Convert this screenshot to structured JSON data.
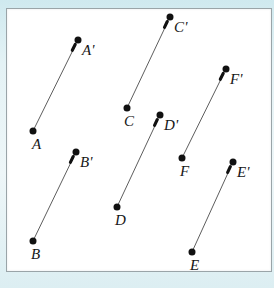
{
  "figure": {
    "background_color": "#d9eef2",
    "plate_color": "#ffffff",
    "border_color": "#9aa4a8",
    "line_color": "#4b4b4b",
    "dot_color": "#111111",
    "label_color": "#161616"
  },
  "segments": [
    {
      "id": "segment-a",
      "start_label": "A",
      "end_label": "A'",
      "start": {
        "x": 33,
        "y": 131
      },
      "end": {
        "x": 78,
        "y": 40
      },
      "start_label_pos": {
        "x": 32,
        "y": 137
      },
      "end_label_pos": {
        "x": 82,
        "y": 43
      }
    },
    {
      "id": "segment-b",
      "start_label": "B",
      "end_label": "B'",
      "start": {
        "x": 33,
        "y": 241
      },
      "end": {
        "x": 76,
        "y": 152
      },
      "start_label_pos": {
        "x": 31,
        "y": 247
      },
      "end_label_pos": {
        "x": 80,
        "y": 155
      }
    },
    {
      "id": "segment-c",
      "start_label": "C",
      "end_label": "C'",
      "start": {
        "x": 127,
        "y": 108
      },
      "end": {
        "x": 170,
        "y": 17
      },
      "start_label_pos": {
        "x": 124,
        "y": 114
      },
      "end_label_pos": {
        "x": 174,
        "y": 20
      }
    },
    {
      "id": "segment-d",
      "start_label": "D",
      "end_label": "D'",
      "start": {
        "x": 117,
        "y": 207
      },
      "end": {
        "x": 160,
        "y": 115
      },
      "start_label_pos": {
        "x": 115,
        "y": 213
      },
      "end_label_pos": {
        "x": 164,
        "y": 118
      }
    },
    {
      "id": "segment-e",
      "start_label": "E",
      "end_label": "E'",
      "start": {
        "x": 192,
        "y": 252
      },
      "end": {
        "x": 233,
        "y": 162
      },
      "start_label_pos": {
        "x": 190,
        "y": 258
      },
      "end_label_pos": {
        "x": 237,
        "y": 165
      }
    },
    {
      "id": "segment-f",
      "start_label": "F",
      "end_label": "F'",
      "start": {
        "x": 182,
        "y": 158
      },
      "end": {
        "x": 226,
        "y": 69
      },
      "start_label_pos": {
        "x": 180,
        "y": 164
      },
      "end_label_pos": {
        "x": 230,
        "y": 72
      }
    }
  ]
}
